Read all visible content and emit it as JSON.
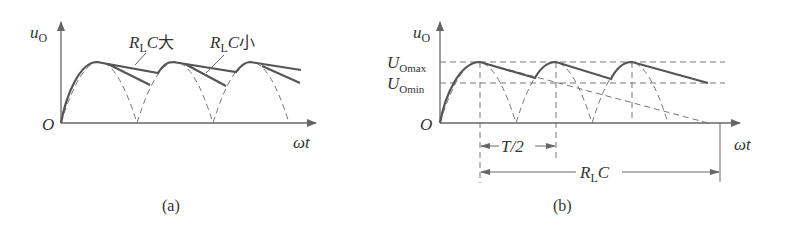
{
  "panel_a": {
    "caption": "(a)",
    "y_axis_label": "u",
    "y_axis_sub": "O",
    "x_axis_label": "ωt",
    "origin_label": "O",
    "annotations": [
      {
        "R": "R",
        "sub": "L",
        "C": "C",
        "cn": "大"
      },
      {
        "R": "R",
        "sub": "L",
        "C": "C",
        "cn": "小"
      }
    ]
  },
  "panel_b": {
    "caption": "(b)",
    "y_axis_label": "u",
    "y_axis_sub": "O",
    "x_axis_label": "ωt",
    "origin_label": "O",
    "level_max": {
      "U": "U",
      "sub": "Omax"
    },
    "level_min": {
      "U": "U",
      "sub": "Omin"
    },
    "dim_half_period": "T/2",
    "dim_time_constant": {
      "R": "R",
      "sub": "L",
      "C": "C"
    }
  },
  "colors": {
    "curve": "#555555",
    "dashed": "#777777",
    "text": "#333333"
  }
}
